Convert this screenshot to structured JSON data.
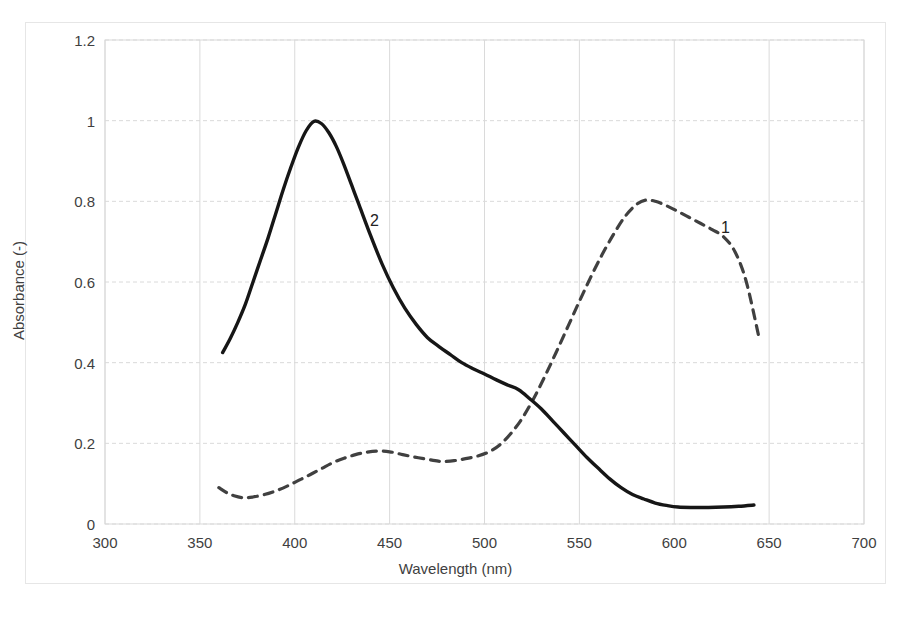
{
  "chart_data": {
    "type": "line",
    "title": "",
    "xlabel": "Wavelength (nm)",
    "ylabel": "Absorbance (-)",
    "xlim": [
      300,
      700
    ],
    "ylim": [
      0,
      1.2
    ],
    "xticks": [
      "300",
      "350",
      "400",
      "450",
      "500",
      "550",
      "600",
      "650",
      "700"
    ],
    "xtick_values": [
      300,
      350,
      400,
      450,
      500,
      550,
      600,
      650,
      700
    ],
    "yticks": [
      "0",
      "0.2",
      "0.4",
      "0.6",
      "0.8",
      "1",
      "1.2"
    ],
    "ytick_values": [
      0,
      0.2,
      0.4,
      0.6,
      0.8,
      1.0,
      1.2
    ],
    "grid": true,
    "legend_position": "inline-annotations",
    "series": [
      {
        "name": "1",
        "style": "dashed",
        "color": "#404040",
        "label_text": "1",
        "label_x": 627,
        "label_y": 0.735,
        "x": [
          360,
          364,
          368,
          373,
          378,
          384,
          390,
          396,
          402,
          408,
          414,
          420,
          426,
          432,
          438,
          444,
          450,
          456,
          462,
          468,
          474,
          478,
          484,
          490,
          496,
          502,
          508,
          514,
          520,
          526,
          532,
          538,
          544,
          550,
          556,
          562,
          568,
          574,
          580,
          585,
          590,
          596,
          602,
          608,
          614,
          620,
          626,
          632,
          638,
          645
        ],
        "y": [
          0.09,
          0.078,
          0.07,
          0.065,
          0.067,
          0.073,
          0.082,
          0.094,
          0.108,
          0.122,
          0.137,
          0.152,
          0.163,
          0.172,
          0.178,
          0.181,
          0.179,
          0.173,
          0.167,
          0.162,
          0.157,
          0.155,
          0.157,
          0.162,
          0.168,
          0.178,
          0.196,
          0.225,
          0.263,
          0.312,
          0.368,
          0.428,
          0.49,
          0.552,
          0.612,
          0.668,
          0.718,
          0.762,
          0.792,
          0.803,
          0.8,
          0.789,
          0.775,
          0.76,
          0.745,
          0.73,
          0.712,
          0.675,
          0.6,
          0.455
        ]
      },
      {
        "name": "2",
        "style": "solid",
        "color": "#161616",
        "label_text": "2",
        "label_x": 442,
        "label_y": 0.752,
        "x": [
          362,
          366,
          370,
          374,
          378,
          382,
          386,
          390,
          394,
          398,
          402,
          406,
          410,
          414,
          418,
          422,
          426,
          430,
          434,
          440,
          446,
          452,
          458,
          464,
          470,
          476,
          482,
          488,
          494,
          500,
          506,
          512,
          518,
          524,
          530,
          536,
          542,
          548,
          554,
          560,
          566,
          572,
          578,
          584,
          590,
          596,
          602,
          610,
          618,
          626,
          634,
          642
        ],
        "y": [
          0.425,
          0.46,
          0.5,
          0.545,
          0.6,
          0.655,
          0.71,
          0.77,
          0.83,
          0.885,
          0.935,
          0.975,
          0.998,
          0.993,
          0.97,
          0.935,
          0.89,
          0.84,
          0.79,
          0.715,
          0.645,
          0.585,
          0.535,
          0.495,
          0.462,
          0.44,
          0.42,
          0.4,
          0.385,
          0.372,
          0.358,
          0.345,
          0.333,
          0.31,
          0.285,
          0.255,
          0.225,
          0.195,
          0.165,
          0.138,
          0.112,
          0.09,
          0.073,
          0.062,
          0.052,
          0.046,
          0.042,
          0.041,
          0.041,
          0.042,
          0.044,
          0.047
        ]
      }
    ]
  }
}
